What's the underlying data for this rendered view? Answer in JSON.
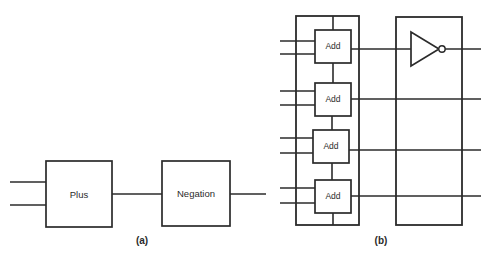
{
  "figure": {
    "width": 491,
    "height": 256,
    "background_color": "#ffffff",
    "line_color": "#2b2b2b",
    "panels": [
      {
        "id": "panel-a",
        "caption": "(a)",
        "caption_x": 142,
        "caption_y": 241,
        "description": "Two cascaded functional blocks: Plus feeding Negation",
        "blocks": [
          {
            "name": "plus-block",
            "label": "Plus",
            "x": 46,
            "y": 161,
            "width": 66,
            "height": 66,
            "label_x": 79,
            "label_y": 195
          },
          {
            "name": "negation-block",
            "label": "Negation",
            "x": 162,
            "y": 161,
            "width": 68,
            "height": 65,
            "label_x": 196,
            "label_y": 194
          }
        ],
        "wires": [
          {
            "name": "plus-input-1",
            "x1": 10,
            "y1": 182,
            "x2": 46,
            "y2": 182
          },
          {
            "name": "plus-input-2",
            "x1": 10,
            "y1": 205,
            "x2": 46,
            "y2": 205
          },
          {
            "name": "plus-to-negation",
            "x1": 112,
            "y1": 194,
            "x2": 162,
            "y2": 194
          },
          {
            "name": "negation-output",
            "x1": 230,
            "y1": 194,
            "x2": 266,
            "y2": 194
          }
        ]
      },
      {
        "id": "panel-b",
        "caption": "(b)",
        "caption_x": 381,
        "caption_y": 241,
        "description": "Expanded view: adder array group feeding an inverter group",
        "groups": [
          {
            "name": "adder-group-box",
            "x": 296,
            "y": 16,
            "width": 63,
            "height": 209
          },
          {
            "name": "inverter-group-box",
            "x": 396,
            "y": 17,
            "width": 66,
            "height": 208
          }
        ],
        "blocks": [
          {
            "name": "add-block-1",
            "label": "Add",
            "x": 315,
            "y": 30,
            "width": 36,
            "height": 33,
            "label_x": 333,
            "label_y": 47
          },
          {
            "name": "add-block-2",
            "label": "Add",
            "x": 315,
            "y": 83,
            "width": 36,
            "height": 33,
            "label_x": 333,
            "label_y": 100
          },
          {
            "name": "add-block-3",
            "label": "Add",
            "x": 313,
            "y": 130,
            "width": 36,
            "height": 33,
            "label_x": 331,
            "label_y": 147
          },
          {
            "name": "add-block-4",
            "label": "Add",
            "x": 315,
            "y": 180,
            "width": 36,
            "height": 33,
            "label_x": 333,
            "label_y": 197
          }
        ],
        "inverter": {
          "name": "not-gate",
          "triangle_points": "411,32 411,66 439,49",
          "bubble_cx": 442,
          "bubble_cy": 49,
          "bubble_r": 3.2,
          "input_wire": {
            "x1": 396,
            "y1": 49,
            "x2": 411,
            "y2": 49
          },
          "output_wire": {
            "x1": 445,
            "y1": 49,
            "x2": 481,
            "y2": 49
          }
        },
        "wires": [
          {
            "name": "add1-input-a",
            "x1": 280,
            "y1": 41,
            "x2": 315,
            "y2": 41
          },
          {
            "name": "add1-input-b",
            "x1": 280,
            "y1": 54,
            "x2": 315,
            "y2": 54
          },
          {
            "name": "add2-input-a",
            "x1": 280,
            "y1": 91,
            "x2": 315,
            "y2": 91
          },
          {
            "name": "add2-input-b",
            "x1": 280,
            "y1": 105,
            "x2": 315,
            "y2": 105
          },
          {
            "name": "add3-input-a",
            "x1": 280,
            "y1": 138,
            "x2": 313,
            "y2": 138
          },
          {
            "name": "add3-input-b",
            "x1": 280,
            "y1": 153,
            "x2": 313,
            "y2": 153
          },
          {
            "name": "add4-input-a",
            "x1": 280,
            "y1": 188,
            "x2": 315,
            "y2": 188
          },
          {
            "name": "add4-input-b",
            "x1": 280,
            "y1": 203,
            "x2": 315,
            "y2": 203
          },
          {
            "name": "add1-carry-in",
            "x1": 333,
            "y1": 16,
            "x2": 333,
            "y2": 30
          },
          {
            "name": "carry-1-to-2",
            "x1": 333,
            "y1": 63,
            "x2": 333,
            "y2": 83
          },
          {
            "name": "carry-2-to-3",
            "x1": 332,
            "y1": 116,
            "x2": 332,
            "y2": 130
          },
          {
            "name": "carry-3-to-4",
            "x1": 332,
            "y1": 163,
            "x2": 332,
            "y2": 180
          },
          {
            "name": "add4-carry-out",
            "x1": 333,
            "y1": 213,
            "x2": 333,
            "y2": 225
          },
          {
            "name": "add1-sum-out",
            "x1": 351,
            "y1": 49,
            "x2": 481,
            "y2": 49
          },
          {
            "name": "add2-sum-out",
            "x1": 351,
            "y1": 99,
            "x2": 481,
            "y2": 99
          },
          {
            "name": "add3-sum-out",
            "x1": 349,
            "y1": 150,
            "x2": 481,
            "y2": 150
          },
          {
            "name": "add4-sum-out",
            "x1": 351,
            "y1": 196,
            "x2": 481,
            "y2": 196
          }
        ]
      }
    ]
  }
}
